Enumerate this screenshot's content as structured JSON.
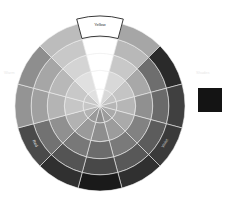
{
  "wheel": {
    "center": [
      100,
      106
    ],
    "radius": 85,
    "rings": 4,
    "selected_segment": "Yellow",
    "segments": [
      {
        "name": "Yellow",
        "shades": [
          "#ffffff",
          "#ffffff",
          "#ffffff",
          "#ffffff"
        ]
      },
      {
        "name": "Yellow-Green",
        "shades": [
          "#d8d8d8",
          "#c8c8c8",
          "#b8b8b8",
          "#a6a6a6"
        ]
      },
      {
        "name": "Green",
        "shades": [
          "#c4c4c4",
          "#a8a8a8",
          "#6e6e6e",
          "#2a2a2a"
        ]
      },
      {
        "name": "Blue-Green",
        "shades": [
          "#b6b6b6",
          "#909090",
          "#6a6a6a",
          "#404040"
        ]
      },
      {
        "name": "Blue",
        "shades": [
          "#aaaaaa",
          "#828282",
          "#5c5c5c",
          "#3a3a3a"
        ]
      },
      {
        "name": "Blue-Violet",
        "shades": [
          "#9c9c9c",
          "#7a7a7a",
          "#585858",
          "#303030"
        ]
      },
      {
        "name": "Violet",
        "shades": [
          "#8e8e8e",
          "#6c6c6c",
          "#484848",
          "#1a1a1a"
        ]
      },
      {
        "name": "Red-Violet",
        "shades": [
          "#9a9a9a",
          "#787878",
          "#545454",
          "#303030"
        ]
      },
      {
        "name": "Red",
        "shades": [
          "#b2b2b2",
          "#909090",
          "#727272",
          "#4a4a4a"
        ]
      },
      {
        "name": "Red-Orange",
        "shades": [
          "#c6c6c6",
          "#b4b4b4",
          "#a0a0a0",
          "#949494"
        ]
      },
      {
        "name": "Orange",
        "shades": [
          "#c8c8c8",
          "#b8b8b8",
          "#a6a6a6",
          "#8e8e8e"
        ]
      },
      {
        "name": "Yellow-Orange",
        "shades": [
          "#e0e0e0",
          "#d4d4d4",
          "#c8c8c8",
          "#bcbcbc"
        ]
      }
    ],
    "labels": {
      "top": "Yellow",
      "lower_left": "Red",
      "lower_right": "Violet"
    }
  },
  "side_labels": {
    "left": "Warm",
    "right": "Shades"
  },
  "swatch": {
    "color": "#141414"
  }
}
